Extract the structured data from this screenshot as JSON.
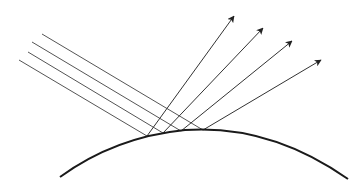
{
  "diagram": {
    "colors": {
      "line": "#555555",
      "surface": "#1a1a1a",
      "background": "#ffffff"
    },
    "surface": {
      "start": [
        60,
        177
      ],
      "control": [
        185,
        112
      ],
      "peak": [
        185,
        130
      ],
      "end": [
        348,
        179
      ]
    },
    "incident_rays": [
      {
        "from": [
          19,
          60
        ],
        "to": [
          147,
          136
        ]
      },
      {
        "from": [
          28,
          52
        ],
        "to": [
          163,
          133
        ]
      },
      {
        "from": [
          32,
          42
        ],
        "to": [
          181,
          131
        ]
      },
      {
        "from": [
          42,
          34
        ],
        "to": [
          203,
          130
        ]
      }
    ],
    "reflected_rays": [
      {
        "from": [
          147,
          136
        ],
        "to": [
          234,
          16
        ]
      },
      {
        "from": [
          163,
          133
        ],
        "to": [
          263,
          28
        ]
      },
      {
        "from": [
          181,
          131
        ],
        "to": [
          292,
          41
        ]
      },
      {
        "from": [
          203,
          130
        ],
        "to": [
          321,
          60
        ]
      }
    ]
  }
}
